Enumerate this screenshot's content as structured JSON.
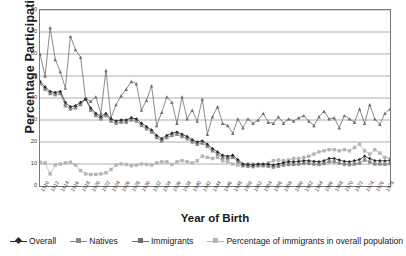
{
  "chart_data": {
    "type": "line",
    "title": "",
    "xlabel": "Year of Birth",
    "ylabel": "Percentage Participating",
    "ylim": [
      0,
      80
    ],
    "ytick_step": 10,
    "yticks": [
      0,
      10,
      20,
      30,
      40,
      50,
      60,
      70,
      80
    ],
    "xlim": [
      1910,
      1979
    ],
    "xtick_labels": [
      "1910",
      "1912",
      "1914",
      "1916",
      "1918",
      "1920",
      "1922",
      "1924",
      "1926",
      "1928",
      "1930",
      "1932",
      "1934",
      "1936",
      "1938",
      "1940",
      "1942",
      "1944",
      "1946",
      "1948",
      "1950",
      "1952",
      "1954",
      "1956",
      "1958",
      "1960",
      "1962",
      "1964",
      "1966",
      "1968",
      "1970",
      "1972",
      "1974",
      "1976",
      "1978"
    ],
    "grid": "horizontal",
    "legend_position": "bottom",
    "x": [
      1910,
      1911,
      1912,
      1913,
      1914,
      1915,
      1916,
      1917,
      1918,
      1919,
      1920,
      1921,
      1922,
      1923,
      1924,
      1925,
      1926,
      1927,
      1928,
      1929,
      1930,
      1931,
      1932,
      1933,
      1934,
      1935,
      1936,
      1937,
      1938,
      1939,
      1940,
      1941,
      1942,
      1943,
      1944,
      1945,
      1946,
      1947,
      1948,
      1949,
      1950,
      1951,
      1952,
      1953,
      1954,
      1955,
      1956,
      1957,
      1958,
      1959,
      1960,
      1961,
      1962,
      1963,
      1964,
      1965,
      1966,
      1967,
      1968,
      1969,
      1970,
      1971,
      1972,
      1973,
      1974,
      1975,
      1976,
      1977,
      1978,
      1979
    ],
    "series": [
      {
        "name": "Overall",
        "color": "#2b2b2b",
        "marker": "diamond",
        "values": [
          47.5,
          45.0,
          43.0,
          42.5,
          43.0,
          38.0,
          36.0,
          36.5,
          38.0,
          39.5,
          35.5,
          33.0,
          31.5,
          33.0,
          30.5,
          29.5,
          30.0,
          30.0,
          31.0,
          30.5,
          28.5,
          27.0,
          25.5,
          23.0,
          21.5,
          23.0,
          24.0,
          24.5,
          23.5,
          22.5,
          21.0,
          20.0,
          20.5,
          19.0,
          17.0,
          15.5,
          14.0,
          13.5,
          14.0,
          12.0,
          10.0,
          9.8,
          9.6,
          10.0,
          10.0,
          9.9,
          9.5,
          10.0,
          10.6,
          11.0,
          11.0,
          11.2,
          11.5,
          11.5,
          11.2,
          11.0,
          11.5,
          12.5,
          12.5,
          11.8,
          11.2,
          11.0,
          11.5,
          12.0,
          13.5,
          12.5,
          11.5,
          11.5,
          11.4,
          11.6
        ]
      },
      {
        "name": "Natives",
        "color": "#8a8a8a",
        "marker": "square",
        "values": [
          46.5,
          44.0,
          42.0,
          41.5,
          42.0,
          36.5,
          35.0,
          35.5,
          37.0,
          39.5,
          34.5,
          32.0,
          30.5,
          32.0,
          29.5,
          28.5,
          29.0,
          29.0,
          30.0,
          29.5,
          27.5,
          26.0,
          24.5,
          22.0,
          20.5,
          22.0,
          23.0,
          23.5,
          22.5,
          21.5,
          20.0,
          19.0,
          19.5,
          18.0,
          16.0,
          14.5,
          13.0,
          12.5,
          13.0,
          11.0,
          9.2,
          9.0,
          8.8,
          9.2,
          9.2,
          9.0,
          8.6,
          9.0,
          9.5,
          9.8,
          9.8,
          10.0,
          10.3,
          10.3,
          10.0,
          9.8,
          10.2,
          11.0,
          11.0,
          10.4,
          9.9,
          9.7,
          10.0,
          10.4,
          11.8,
          10.9,
          10.0,
          10.0,
          9.9,
          10.1
        ]
      },
      {
        "name": "Immigrants",
        "color": "#6e6e6e",
        "marker": "triangle",
        "values": [
          60.0,
          50.0,
          72.0,
          57.5,
          52.0,
          44.5,
          68.0,
          62.0,
          58.5,
          39.5,
          38.5,
          40.5,
          33.0,
          52.5,
          31.0,
          37.0,
          41.0,
          44.0,
          47.5,
          46.5,
          34.5,
          39.0,
          45.5,
          27.5,
          33.5,
          40.5,
          38.0,
          28.5,
          40.5,
          30.5,
          34.5,
          29.5,
          39.5,
          23.5,
          31.5,
          36.0,
          28.5,
          27.5,
          24.0,
          30.5,
          26.5,
          30.5,
          28.5,
          30.0,
          33.0,
          29.0,
          28.5,
          31.5,
          28.5,
          30.5,
          29.5,
          31.0,
          32.0,
          29.5,
          27.5,
          31.5,
          34.0,
          30.5,
          31.0,
          26.5,
          32.0,
          30.5,
          29.0,
          35.0,
          28.5,
          37.0,
          30.5,
          28.0,
          33.0,
          35.0
        ]
      },
      {
        "name": "Percentage of immigrants in overall population",
        "color": "#b5b5b5",
        "marker": "square",
        "values": [
          10.8,
          10.5,
          5.5,
          9.5,
          10.0,
          10.5,
          10.8,
          9.5,
          7.0,
          5.5,
          5.2,
          5.3,
          5.5,
          6.0,
          7.5,
          9.5,
          10.0,
          9.8,
          9.2,
          9.5,
          10.0,
          9.8,
          9.5,
          10.5,
          11.0,
          11.0,
          9.8,
          11.0,
          11.5,
          11.0,
          10.5,
          11.5,
          13.5,
          13.0,
          12.5,
          13.0,
          11.5,
          11.0,
          10.0,
          9.5,
          9.5,
          10.0,
          10.0,
          9.5,
          9.5,
          10.5,
          11.5,
          11.8,
          11.5,
          11.8,
          12.5,
          12.5,
          13.0,
          13.5,
          14.5,
          15.5,
          16.0,
          16.5,
          16.5,
          16.0,
          16.5,
          16.0,
          17.5,
          19.0,
          16.0,
          14.5,
          16.5,
          15.0,
          13.0,
          12.5
        ]
      }
    ]
  },
  "legend": {
    "entries": [
      {
        "label": "Overall"
      },
      {
        "label": "Natives"
      },
      {
        "label": "Immigrants"
      },
      {
        "label": "Percentage of immigrants in overall population"
      }
    ]
  }
}
